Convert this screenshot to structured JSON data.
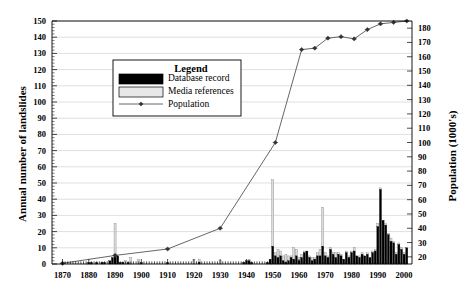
{
  "chart_data": {
    "type": "bar",
    "title": "",
    "xlabel": "",
    "ylabel": "Annual number of landslides",
    "y2label": "Population (1000's)",
    "xlim": [
      1866,
      2003
    ],
    "ylim": [
      0,
      150
    ],
    "y2lim": [
      15,
      185
    ],
    "grid": true,
    "legend_position": "upper-left-inside",
    "legend_title": "Legend",
    "xticks": [
      1870,
      1880,
      1890,
      1900,
      1910,
      1920,
      1930,
      1940,
      1950,
      1960,
      1970,
      1980,
      1990,
      2000
    ],
    "yticks": [
      0,
      10,
      20,
      30,
      40,
      50,
      60,
      70,
      80,
      90,
      100,
      110,
      120,
      130,
      140,
      150
    ],
    "y2ticks": [
      20,
      30,
      40,
      50,
      60,
      70,
      80,
      90,
      100,
      110,
      120,
      130,
      140,
      150,
      160,
      170,
      180
    ],
    "yminor_step": 2,
    "xminor_step": 1,
    "series": [
      {
        "name": "Database record",
        "type": "bar",
        "color": "#000000",
        "x": [
          1870,
          1871,
          1872,
          1873,
          1874,
          1875,
          1876,
          1877,
          1878,
          1879,
          1880,
          1881,
          1882,
          1883,
          1884,
          1885,
          1886,
          1887,
          1888,
          1889,
          1890,
          1891,
          1892,
          1893,
          1894,
          1895,
          1896,
          1897,
          1898,
          1899,
          1900,
          1901,
          1902,
          1903,
          1904,
          1905,
          1906,
          1907,
          1908,
          1909,
          1910,
          1911,
          1912,
          1913,
          1914,
          1915,
          1916,
          1917,
          1918,
          1919,
          1920,
          1921,
          1922,
          1923,
          1924,
          1925,
          1926,
          1927,
          1928,
          1929,
          1930,
          1931,
          1932,
          1933,
          1934,
          1935,
          1936,
          1937,
          1938,
          1939,
          1940,
          1941,
          1942,
          1943,
          1944,
          1945,
          1946,
          1947,
          1948,
          1949,
          1950,
          1951,
          1952,
          1953,
          1954,
          1955,
          1956,
          1957,
          1958,
          1959,
          1960,
          1961,
          1962,
          1963,
          1964,
          1965,
          1966,
          1967,
          1968,
          1969,
          1970,
          1971,
          1972,
          1973,
          1974,
          1975,
          1976,
          1977,
          1978,
          1979,
          1980,
          1981,
          1982,
          1983,
          1984,
          1985,
          1986,
          1987,
          1988,
          1989,
          1990,
          1991,
          1992,
          1993,
          1994,
          1995,
          1996,
          1997,
          1998,
          1999,
          2000,
          2001
        ],
        "values": [
          1,
          0,
          0,
          0,
          0,
          0,
          0,
          0,
          0,
          0,
          1,
          1,
          0,
          1,
          0,
          1,
          1,
          0,
          2,
          4,
          6,
          5,
          1,
          1,
          0,
          1,
          0,
          0,
          0,
          0,
          1,
          0,
          0,
          0,
          0,
          0,
          0,
          0,
          0,
          0,
          1,
          0,
          0,
          0,
          0,
          0,
          0,
          0,
          0,
          0,
          0,
          0,
          1,
          0,
          0,
          0,
          0,
          0,
          0,
          0,
          0,
          0,
          0,
          0,
          0,
          0,
          0,
          0,
          0,
          1,
          2,
          2,
          1,
          0,
          0,
          0,
          0,
          0,
          1,
          3,
          11,
          5,
          4,
          5,
          2,
          1,
          2,
          4,
          3,
          5,
          2,
          4,
          7,
          8,
          4,
          2,
          3,
          5,
          5,
          11,
          5,
          4,
          9,
          6,
          4,
          6,
          5,
          3,
          7,
          4,
          7,
          8,
          5,
          4,
          6,
          5,
          6,
          4,
          7,
          8,
          23,
          46,
          27,
          24,
          18,
          14,
          13,
          6,
          12,
          9,
          6,
          10
        ]
      },
      {
        "name": "Media references",
        "type": "bar",
        "color": "#dcdcdc",
        "note": "stacked on top of database record",
        "x": [
          1870,
          1871,
          1872,
          1873,
          1874,
          1875,
          1876,
          1877,
          1878,
          1879,
          1880,
          1881,
          1882,
          1883,
          1884,
          1885,
          1886,
          1887,
          1888,
          1889,
          1890,
          1891,
          1892,
          1893,
          1894,
          1895,
          1896,
          1897,
          1898,
          1899,
          1900,
          1901,
          1902,
          1903,
          1904,
          1905,
          1906,
          1907,
          1908,
          1909,
          1910,
          1911,
          1912,
          1913,
          1914,
          1915,
          1916,
          1917,
          1918,
          1919,
          1920,
          1921,
          1922,
          1923,
          1924,
          1925,
          1926,
          1927,
          1928,
          1929,
          1930,
          1931,
          1932,
          1933,
          1934,
          1935,
          1936,
          1937,
          1938,
          1939,
          1940,
          1941,
          1942,
          1943,
          1944,
          1945,
          1946,
          1947,
          1948,
          1949,
          1950,
          1951,
          1952,
          1953,
          1954,
          1955,
          1956,
          1957,
          1958,
          1959,
          1960,
          1961,
          1962,
          1963,
          1964,
          1965,
          1966,
          1967,
          1968,
          1969,
          1970,
          1971,
          1972,
          1973,
          1974,
          1975,
          1976,
          1977,
          1978,
          1979,
          1980,
          1981,
          1982,
          1983,
          1984,
          1985,
          1986,
          1987,
          1988,
          1989,
          1990,
          1991,
          1992,
          1993,
          1994,
          1995,
          1996,
          1997,
          1998,
          1999,
          2000,
          2001
        ],
        "values": [
          0,
          0,
          0,
          0,
          0,
          0,
          0,
          0,
          0,
          0,
          0,
          0,
          0,
          0,
          0,
          0,
          0,
          0,
          0,
          0,
          19,
          0,
          0,
          0,
          2,
          0,
          4,
          0,
          0,
          3,
          0,
          0,
          0,
          0,
          0,
          0,
          0,
          0,
          0,
          0,
          0,
          0,
          0,
          0,
          0,
          0,
          0,
          0,
          0,
          0,
          3,
          0,
          2,
          0,
          0,
          0,
          0,
          0,
          0,
          0,
          2,
          0,
          0,
          0,
          0,
          0,
          0,
          0,
          0,
          0,
          0,
          1,
          0,
          0,
          0,
          0,
          0,
          0,
          0,
          0,
          41,
          2,
          5,
          3,
          3,
          5,
          3,
          1,
          7,
          4,
          2,
          2,
          1,
          0,
          1,
          2,
          1,
          2,
          4,
          24,
          2,
          1,
          1,
          1,
          3,
          1,
          1,
          0,
          1,
          1,
          1,
          2,
          0,
          1,
          1,
          0,
          1,
          0,
          1,
          1,
          2,
          1,
          0,
          1,
          1,
          2,
          1,
          1,
          1,
          1,
          1,
          0
        ]
      },
      {
        "name": "Population",
        "type": "line",
        "color": "#555555",
        "marker": "diamond",
        "axis": "right",
        "x": [
          1870,
          1890,
          1910,
          1930,
          1951,
          1961,
          1966,
          1971,
          1976,
          1981,
          1986,
          1991,
          1996,
          2001
        ],
        "values": [
          15.5,
          21,
          25.5,
          40,
          100,
          165,
          166,
          173,
          174,
          172.5,
          179,
          183,
          184,
          185
        ]
      }
    ]
  },
  "legend": {
    "title": "Legend",
    "items": [
      {
        "label": "Database record",
        "swatch": "solid-black",
        "color": "#000000"
      },
      {
        "label": "Media references",
        "swatch": "solid-light",
        "color": "#e8e8e8"
      },
      {
        "label": "Population",
        "swatch": "line-marker",
        "color": "#555555"
      }
    ]
  }
}
